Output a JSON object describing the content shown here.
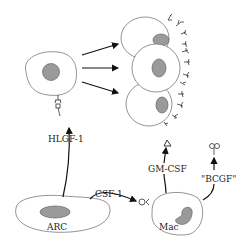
{
  "diagram": {
    "type": "cell-signaling",
    "nodes": [
      {
        "id": "precursor",
        "label": "",
        "description": "progenitor cell with nucleus"
      },
      {
        "id": "differentiated",
        "label": "",
        "description": "three stacked cells with dendritic surface projections"
      },
      {
        "id": "arc",
        "label": "ARC"
      },
      {
        "id": "mac",
        "label": "Mac"
      }
    ],
    "edges": [
      {
        "from": "arc",
        "to": "precursor",
        "label": "HLGF-1"
      },
      {
        "from": "arc",
        "to": "mac",
        "label": "CSF-1"
      },
      {
        "from": "mac",
        "to": "differentiated",
        "label": "GM-CSF"
      },
      {
        "from": "mac",
        "to": "bcgf-target",
        "label": "\"BCGF\""
      },
      {
        "from": "precursor",
        "to": "differentiated",
        "label": "",
        "count": 3
      }
    ],
    "labels": {
      "hlgf": "HLGF-1",
      "csf": "CSF-1",
      "gmcsf": "GM-CSF",
      "bcgf": "\"BCGF\"",
      "arc": "ARC",
      "mac": "Mac"
    },
    "colors": {
      "nucleus": "#9a9a9a",
      "outline": "#777777",
      "line": "#111111"
    }
  }
}
